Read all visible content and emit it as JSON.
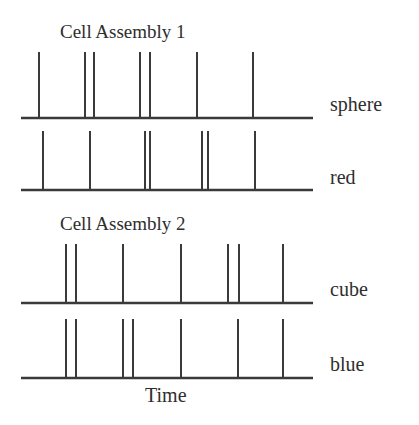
{
  "figure": {
    "title_1": "Cell Assembly 1",
    "title_2": "Cell Assembly 2",
    "axis_label_x": "Time",
    "line_color": "#3a3a3a",
    "background_color": "#ffffff",
    "width": 419,
    "height": 425
  },
  "chart_data": {
    "type": "raster",
    "xlabel": "Time",
    "ylabel": "",
    "grid": false,
    "legend": "none",
    "axis_x_start": 21,
    "axis_x_end": 313,
    "groups": [
      {
        "name": "Cell Assembly 1",
        "label": "Cell Assembly 1",
        "label_x": 60,
        "label_y": 22,
        "trains": [
          {
            "name": "sphere",
            "label": "sphere",
            "label_x": 330,
            "label_y": 94,
            "baseline_y": 118,
            "spike_height": 66,
            "spikes": [
              39,
              85,
              94,
              140,
              150,
              197,
              253
            ]
          },
          {
            "name": "red",
            "label": "red",
            "label_x": 330,
            "label_y": 167,
            "baseline_y": 190,
            "spike_height": 59,
            "spikes": [
              43,
              90,
              145,
              150,
              202,
              208,
              255
            ]
          }
        ]
      },
      {
        "name": "Cell Assembly 2",
        "label": "Cell Assembly 2",
        "label_x": 60,
        "label_y": 214,
        "trains": [
          {
            "name": "cube",
            "label": "cube",
            "label_x": 330,
            "label_y": 279,
            "baseline_y": 303,
            "spike_height": 59,
            "spikes": [
              66,
              76,
              123,
              181,
              228,
              239,
              283
            ]
          },
          {
            "name": "blue",
            "label": "blue",
            "label_x": 330,
            "label_y": 354,
            "baseline_y": 378,
            "spike_height": 59,
            "spikes": [
              66,
              76,
              123,
              133,
              181,
              238,
              283
            ]
          }
        ]
      }
    ],
    "axis_label_position": {
      "x": 145,
      "y": 385
    }
  }
}
